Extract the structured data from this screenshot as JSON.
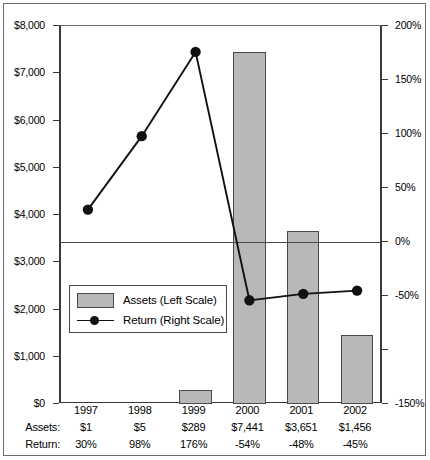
{
  "chart_data": {
    "type": "bar",
    "title": "",
    "subtitle": "",
    "categories": [
      "1997",
      "1998",
      "1999",
      "2000",
      "2001",
      "2002"
    ],
    "series": [
      {
        "name": "Assets (Left Scale)",
        "type": "bar",
        "axis": "left",
        "values": [
          1,
          5,
          289,
          7441,
          3651,
          1456
        ],
        "value_labels": [
          "$1",
          "$5",
          "$289",
          "$7,441",
          "$3,651",
          "$1,456"
        ],
        "color": "#b8b8b8"
      },
      {
        "name": "Return (Right Scale)",
        "type": "line",
        "axis": "right",
        "values": [
          30,
          98,
          176,
          -54,
          -48,
          -45
        ],
        "value_labels": [
          "30%",
          "98%",
          "176%",
          "-54%",
          "-48%",
          "-45%"
        ],
        "color": "#111111"
      }
    ],
    "xlabel": "",
    "ylabel": "Beginning Year, in Millions",
    "y2label": "Calenar Year Returns",
    "ylim": [
      0,
      8000
    ],
    "y2lim": [
      -150,
      200
    ],
    "yticks": [
      0,
      1000,
      2000,
      3000,
      4000,
      5000,
      6000,
      7000,
      8000
    ],
    "ytick_labels": [
      "$0",
      "$1,000",
      "$2,000",
      "$3,000",
      "$4,000",
      "$5,000",
      "$6,000",
      "$7,000",
      "$8,000"
    ],
    "y2ticks": [
      -150,
      -100,
      -50,
      0,
      50,
      100,
      150,
      200
    ],
    "y2tick_labels": [
      "-150%",
      "",
      "-50%",
      "0%",
      "50%",
      "100%",
      "150%",
      "200%"
    ],
    "grid": false,
    "zero_line": true,
    "legend_position": "inside-lower-left"
  },
  "axes": {
    "left_title": "Beginning Year, in Millions",
    "right_title": "Calenar Year Returns"
  },
  "legend": {
    "items": [
      {
        "label": "Assets (Left Scale)",
        "marker": "swatch"
      },
      {
        "label": "Return (Right Scale)",
        "marker": "line-dot"
      }
    ]
  },
  "table": {
    "row_labels": {
      "assets": "Assets:",
      "return": "Return:"
    },
    "years": [
      "1997",
      "1998",
      "1999",
      "2000",
      "2001",
      "2002"
    ],
    "assets": [
      "$1",
      "$5",
      "$289",
      "$7,441",
      "$3,651",
      "$1,456"
    ],
    "returns": [
      "30%",
      "98%",
      "176%",
      "-54%",
      "-48%",
      "-45%"
    ]
  },
  "colors": {
    "bar_fill": "#b8b8b8",
    "bar_stroke": "#4a4a4a",
    "line": "#111111",
    "frame": "#6e6e6e",
    "axis": "#3a3a3a"
  }
}
